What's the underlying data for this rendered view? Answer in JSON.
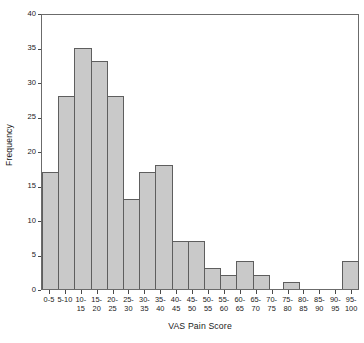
{
  "chart_data": {
    "type": "bar",
    "title": "",
    "xlabel": "VAS Pain Score",
    "ylabel": "Frequency",
    "grid": false,
    "legend": null,
    "ylim": [
      0,
      40
    ],
    "yticks": [
      0,
      5,
      10,
      15,
      20,
      25,
      30,
      35,
      40
    ],
    "ytick_labels": [
      "0",
      "5",
      "10",
      "15",
      "20",
      "25",
      "30",
      "35",
      "40"
    ],
    "categories": [
      "0-5",
      "5-10",
      "10-15",
      "15-20",
      "20-25",
      "25-30",
      "30-35",
      "35-40",
      "40-45",
      "45-50",
      "50-55",
      "55-60",
      "60-65",
      "65-70",
      "70-75",
      "75-80",
      "80-85",
      "85-90",
      "90-95",
      "95-100"
    ],
    "xtick_line1": [
      "0-5",
      "5-10",
      "10-",
      "15-",
      "20-",
      "25-",
      "30-",
      "35-",
      "40-",
      "45-",
      "50-",
      "55-",
      "60-",
      "65-",
      "70-",
      "75-",
      "80-",
      "85-",
      "90-",
      "95-"
    ],
    "xtick_line2": [
      "",
      "",
      "15",
      "20",
      "25",
      "30",
      "35",
      "40",
      "45",
      "50",
      "55",
      "60",
      "65",
      "70",
      "75",
      "80",
      "85",
      "90",
      "95",
      "100"
    ],
    "values": [
      17,
      28,
      35,
      33,
      28,
      13,
      17,
      18,
      7,
      7,
      3,
      2,
      4,
      2,
      0,
      1,
      0,
      0,
      0,
      4
    ],
    "bar_fill_color": "#c9c9c9",
    "bar_edge_color": "#5e5e5e",
    "axis_color": "#6b6b6b",
    "text_color": "#1a1a1a",
    "background_color": "#ffffff"
  }
}
